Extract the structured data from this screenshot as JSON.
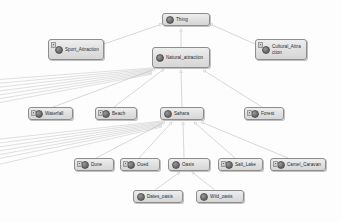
{
  "diagram": {
    "type": "class-hierarchy-graph",
    "background_color": "#fdfdfd",
    "node_fill_color": "#e2e2e2",
    "node_border_color": "#8d8d8d",
    "edge_color": "#b9b9b9",
    "label_color": "#2b2b2b",
    "icon_name": "owl-class-icon",
    "edge_marker": "hollow-triangle-arrowhead",
    "edge_direction": "child-to-parent"
  },
  "nodes": [
    {
      "id": "thing",
      "label": "Thing",
      "x": 162,
      "y": 13,
      "w": 48,
      "h": 13,
      "has_subclass_marker": false
    },
    {
      "id": "sport_attraction",
      "label": "Sport_Attraction",
      "x": 48,
      "y": 39,
      "w": 56,
      "h": 21,
      "has_subclass_marker": true
    },
    {
      "id": "natural_attraction",
      "label": "Natural_attraction",
      "x": 152,
      "y": 47,
      "w": 58,
      "h": 21,
      "has_subclass_marker": false
    },
    {
      "id": "cultural_attraction",
      "label": "Cultural_Attraction",
      "x": 255,
      "y": 39,
      "w": 52,
      "h": 21,
      "has_subclass_marker": true
    },
    {
      "id": "waterfall",
      "label": "Waterfall",
      "x": 28,
      "y": 107,
      "w": 45,
      "h": 13,
      "has_subclass_marker": true
    },
    {
      "id": "beach",
      "label": "Beach",
      "x": 95,
      "y": 107,
      "w": 42,
      "h": 13,
      "has_subclass_marker": true
    },
    {
      "id": "sahara",
      "label": "Sahara",
      "x": 160,
      "y": 107,
      "w": 44,
      "h": 13,
      "has_subclass_marker": false
    },
    {
      "id": "forest",
      "label": "Forest",
      "x": 244,
      "y": 107,
      "w": 40,
      "h": 13,
      "has_subclass_marker": true
    },
    {
      "id": "dune",
      "label": "Dune",
      "x": 74,
      "y": 158,
      "w": 40,
      "h": 13,
      "has_subclass_marker": true
    },
    {
      "id": "oued",
      "label": "Oued",
      "x": 120,
      "y": 158,
      "w": 40,
      "h": 13,
      "has_subclass_marker": true
    },
    {
      "id": "oasis",
      "label": "Oasis",
      "x": 168,
      "y": 158,
      "w": 42,
      "h": 13,
      "has_subclass_marker": false
    },
    {
      "id": "salt_lake",
      "label": "Salt_Lake",
      "x": 218,
      "y": 158,
      "w": 45,
      "h": 13,
      "has_subclass_marker": true
    },
    {
      "id": "camel_caravan",
      "label": "Camel_Caravan",
      "x": 270,
      "y": 158,
      "w": 56,
      "h": 13,
      "has_subclass_marker": true
    },
    {
      "id": "dates_oasis",
      "label": "Dates_oasis",
      "x": 133,
      "y": 190,
      "w": 50,
      "h": 13,
      "has_subclass_marker": false
    },
    {
      "id": "wild_oasis",
      "label": "Wild_oasis",
      "x": 196,
      "y": 190,
      "w": 48,
      "h": 13,
      "has_subclass_marker": false
    }
  ],
  "edges": [
    {
      "from": "sport_attraction",
      "to": "thing"
    },
    {
      "from": "natural_attraction",
      "to": "thing"
    },
    {
      "from": "cultural_attraction",
      "to": "thing"
    },
    {
      "from": "waterfall",
      "to": "natural_attraction"
    },
    {
      "from": "beach",
      "to": "natural_attraction"
    },
    {
      "from": "sahara",
      "to": "natural_attraction"
    },
    {
      "from": "forest",
      "to": "natural_attraction"
    },
    {
      "from": "dune",
      "to": "sahara"
    },
    {
      "from": "oued",
      "to": "sahara"
    },
    {
      "from": "oasis",
      "to": "sahara"
    },
    {
      "from": "salt_lake",
      "to": "sahara"
    },
    {
      "from": "camel_caravan",
      "to": "sahara"
    },
    {
      "from": "dates_oasis",
      "to": "oasis"
    },
    {
      "from": "wild_oasis",
      "to": "oasis"
    }
  ],
  "offscreen_edge_bundles": [
    {
      "id": "bundle-natural",
      "from": "natural_attraction",
      "direction": "left-offscreen",
      "count": 7
    },
    {
      "id": "bundle-sahara",
      "from": "sahara",
      "direction": "left-offscreen",
      "count": 7
    }
  ]
}
